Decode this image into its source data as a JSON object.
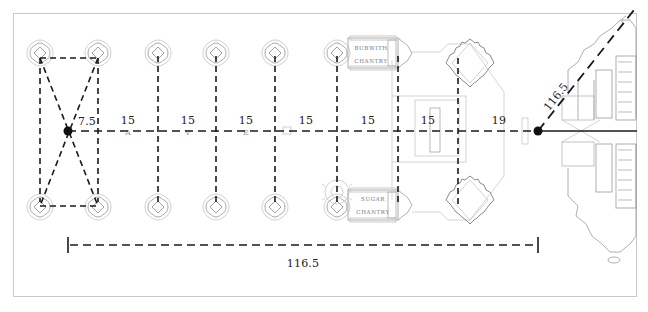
{
  "diagram": {
    "type": "architectural-plan-with-dimensions",
    "colors": {
      "dimension_line": "#1a1a1a",
      "plan_lines": "#9a9a9a",
      "frame": "#c8c8c8",
      "background": "#ffffff"
    },
    "bay_dimensions": [
      {
        "id": "bay-0",
        "label": "7.5"
      },
      {
        "id": "bay-1",
        "label": "15"
      },
      {
        "id": "bay-2",
        "label": "15"
      },
      {
        "id": "bay-3",
        "label": "15"
      },
      {
        "id": "bay-4",
        "label": "15"
      },
      {
        "id": "bay-5",
        "label": "15"
      },
      {
        "id": "bay-6",
        "label": "15"
      },
      {
        "id": "bay-7",
        "label": "19"
      }
    ],
    "overall_length": {
      "label": "116.5"
    },
    "diagonal_length": {
      "label": "116.5"
    },
    "chantries": [
      {
        "name_line1": "BUBWITH",
        "name_line2": "CHANTRY"
      },
      {
        "name_line1": "SUGAR",
        "name_line2": "CHANTRY"
      }
    ],
    "nave_letters": [
      "A",
      "V",
      "E"
    ]
  }
}
